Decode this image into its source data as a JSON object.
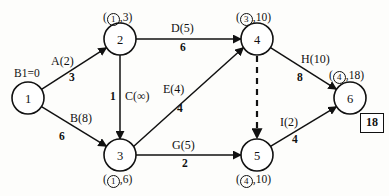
{
  "diagram": {
    "nodes": [
      {
        "id": "1",
        "cx": 28,
        "cy": 98,
        "r": 16,
        "annotation": "B1=0",
        "annot_circled": "",
        "annot_value": "",
        "annot_pos": "above"
      },
      {
        "id": "2",
        "cx": 120,
        "cy": 39,
        "r": 16,
        "annotation": "(①,3)",
        "annot_circled": "1",
        "annot_value": "3",
        "annot_pos": "above"
      },
      {
        "id": "3",
        "cx": 120,
        "cy": 155,
        "r": 16,
        "annotation": "(①,6)",
        "annot_circled": "1",
        "annot_value": "6",
        "annot_pos": "below"
      },
      {
        "id": "4",
        "cx": 257,
        "cy": 39,
        "r": 16,
        "annotation": "(③,10)",
        "annot_circled": "3",
        "annot_value": "10",
        "annot_pos": "above"
      },
      {
        "id": "5",
        "cx": 257,
        "cy": 155,
        "r": 16,
        "annotation": "(④,10)",
        "annot_circled": "4",
        "annot_value": "10",
        "annot_pos": "below"
      },
      {
        "id": "6",
        "cx": 350,
        "cy": 98,
        "r": 16,
        "annotation": "(④,18)",
        "annot_circled": "4",
        "annot_value": "18",
        "annot_pos": "above"
      }
    ],
    "edges": [
      {
        "name": "A(2)",
        "weight": "3",
        "from": "1",
        "to": "2",
        "style": "solid",
        "arrow": true
      },
      {
        "name": "B(8)",
        "weight": "6",
        "from": "1",
        "to": "3",
        "style": "solid",
        "arrow": true
      },
      {
        "name": "C(∞)",
        "weight": "1",
        "from": "2",
        "to": "3",
        "style": "solid",
        "arrow": true
      },
      {
        "name": "D(5)",
        "weight": "6",
        "from": "2",
        "to": "4",
        "style": "solid",
        "arrow": true
      },
      {
        "name": "E(4)",
        "weight": "4",
        "from": "3",
        "to": "4",
        "style": "solid",
        "arrow": true
      },
      {
        "name": "G(5)",
        "weight": "2",
        "from": "3",
        "to": "5",
        "style": "solid",
        "arrow": true
      },
      {
        "name": "H(10)",
        "weight": "8",
        "from": "4",
        "to": "6",
        "style": "solid",
        "arrow": true
      },
      {
        "name": "I(2)",
        "weight": "4",
        "from": "5",
        "to": "6",
        "style": "solid",
        "arrow": true
      },
      {
        "name": "",
        "weight": "",
        "from": "4",
        "to": "5",
        "style": "dashed",
        "arrow": true
      }
    ],
    "result_box": {
      "value": "18"
    },
    "colors": {
      "stroke": "#111111",
      "node_fill": "#ffffff",
      "background": "#fdfdfb"
    }
  },
  "labels": {
    "node1_annot": "B1=0",
    "node2_open": "(",
    "node2_circ": "1",
    "node2_rest": ",3)",
    "node3_open": "(",
    "node3_circ": "1",
    "node3_rest": ",6)",
    "node4_open": "(",
    "node4_circ": "3",
    "node4_rest": ",10)",
    "node5_open": "(",
    "node5_circ": "4",
    "node5_rest": ",10)",
    "node6_open": "(",
    "node6_circ": "4",
    "node6_rest": ",18)",
    "edgeA_name": "A(2)",
    "edgeA_weight": "3",
    "edgeB_name": "B(8)",
    "edgeB_weight": "6",
    "edgeC_name": "C(∞)",
    "edgeC_weight": "1",
    "edgeD_name": "D(5)",
    "edgeD_weight": "6",
    "edgeE_name": "E(4)",
    "edgeE_weight": "4",
    "edgeG_name": "G(5)",
    "edgeG_weight": "2",
    "edgeH_name": "H(10)",
    "edgeH_weight": "8",
    "edgeI_name": "I(2)",
    "edgeI_weight": "4",
    "node1_id": "1",
    "node2_id": "2",
    "node3_id": "3",
    "node4_id": "4",
    "node5_id": "5",
    "node6_id": "6",
    "result_value": "18"
  }
}
